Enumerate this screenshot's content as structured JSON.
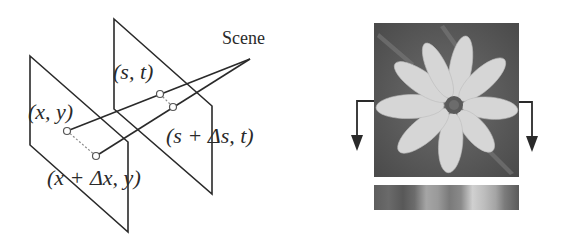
{
  "figure": {
    "left_panel": {
      "title": "Light field two-plane parameterization",
      "scene_label": "Scene",
      "points": {
        "camera_plane_point": "(x, y)",
        "camera_plane_shifted": "(x + Δx, y)",
        "focal_plane_point": "(s, t)",
        "focal_plane_shifted": "(s + Δs, t)"
      }
    },
    "right_panel": {
      "image_subject": "flower photograph (grayscale)",
      "strip_label": "",
      "arrows": [
        "left-down-arrow",
        "right-down-arrow"
      ]
    },
    "colors": {
      "line": "#2a2a2a",
      "dotted": "#8a8a8a",
      "background": "#ffffff"
    }
  }
}
